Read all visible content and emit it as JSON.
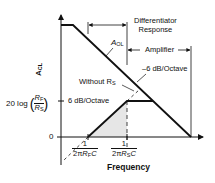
{
  "diagram": {
    "type": "bode-plot",
    "y_axis_label": "A",
    "y_axis_label_sub": "CL",
    "x_axis_label": "Frequency",
    "y_ticks": {
      "zero": "0",
      "gain_prefix": "20 log",
      "gain_num": "R",
      "gain_num_sub": "F",
      "gain_den": "R",
      "gain_den_sub": "S"
    },
    "x_ticks": [
      {
        "num": "1",
        "den_prefix": "2π",
        "den_r": "R",
        "den_sub": "F",
        "den_suffix": "C"
      },
      {
        "num": "1",
        "den_prefix": "2π",
        "den_r": "R",
        "den_sub": "S",
        "den_suffix": "C"
      }
    ],
    "annotations": {
      "aol": "A",
      "aol_sub": "OL",
      "differentiator_line1": "Differentiator",
      "differentiator_line2": "Response",
      "amplifier": "Amplifier",
      "neg_slope": "–6 dB/Octave",
      "pos_slope": "6 dB/Octave",
      "without_rs": "Without R",
      "without_rs_sub": "S"
    },
    "colors": {
      "line": "#111111",
      "shade": "#e6e6e6",
      "background": "#ffffff"
    }
  }
}
